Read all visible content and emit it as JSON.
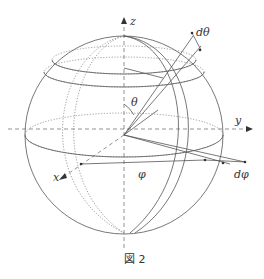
{
  "figure": {
    "caption": "図 2",
    "labels": {
      "z": "z",
      "y": "y",
      "x": "x",
      "theta": "θ",
      "phi": "φ",
      "d_theta": "dθ",
      "d_phi": "dφ"
    },
    "colors": {
      "line": "#555555",
      "text": "#333333",
      "background": "#ffffff"
    }
  }
}
